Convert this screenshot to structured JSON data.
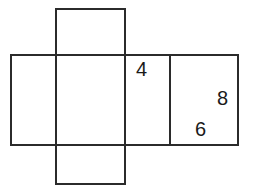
{
  "figure": {
    "type": "net-of-rectangular-prism",
    "title": "",
    "background_color": "#ffffff",
    "stroke_color": "#2b2b2b",
    "stroke_width": 2,
    "labels": [
      {
        "id": "label-4",
        "text": "4",
        "x": 136,
        "y": 59,
        "panel": "fourth-panel"
      },
      {
        "id": "label-8",
        "text": "8",
        "x": 217,
        "y": 88,
        "panel": "right-panel"
      },
      {
        "id": "label-6",
        "text": "6",
        "x": 195,
        "y": 119,
        "panel": "right-panel"
      }
    ],
    "panels": [
      {
        "name": "left-panel",
        "x": 11,
        "y": 55,
        "width": 45,
        "height": 90
      },
      {
        "name": "top-flap",
        "x": 56,
        "y": 9,
        "width": 69,
        "height": 46
      },
      {
        "name": "center-panel",
        "x": 56,
        "y": 55,
        "width": 69,
        "height": 90
      },
      {
        "name": "fourth-panel",
        "x": 125,
        "y": 55,
        "width": 45,
        "height": 90
      },
      {
        "name": "right-panel",
        "x": 170,
        "y": 55,
        "width": 68,
        "height": 90
      },
      {
        "name": "bottom-flap",
        "x": 56,
        "y": 145,
        "width": 69,
        "height": 39
      }
    ]
  }
}
